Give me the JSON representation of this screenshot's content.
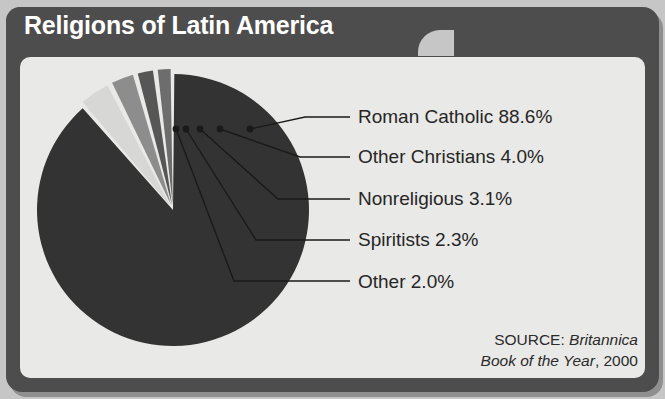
{
  "header": {
    "title": "Religions of Latin America"
  },
  "source": {
    "prefix": "SOURCE: ",
    "italic1": "Britannica",
    "italic2": "Book of the Year",
    "suffix": ", 2000"
  },
  "colors": {
    "frame": "#4d4d4d",
    "panel": "#e9e9e7",
    "background": "#c6c6c6",
    "title_text": "#ffffff",
    "label_text": "#262626",
    "leader_line": "#1a1a1a"
  },
  "chart_data": {
    "type": "pie",
    "title": "Religions of Latin America",
    "unit": "percent",
    "start_angle_deg": 0,
    "direction": "clockwise",
    "legend": "callout-labels",
    "grid": false,
    "categories": [
      "Roman Catholic",
      "Other Christians",
      "Nonreligious",
      "Spiritists",
      "Other"
    ],
    "values": [
      88.6,
      4.0,
      3.1,
      2.3,
      2.0
    ],
    "slice_colors": [
      "#333333",
      "#d7d7d5",
      "#8d8d8d",
      "#565656",
      "#6d6d6d"
    ],
    "slices": [
      {
        "label": "Roman Catholic 88.6%",
        "name": "Roman Catholic",
        "value": 88.6,
        "color": "#333333"
      },
      {
        "label": "Other Christians 4.0%",
        "name": "Other Christians",
        "value": 4.0,
        "color": "#d7d7d5"
      },
      {
        "label": "Nonreligious 3.1%",
        "name": "Nonreligious",
        "value": 3.1,
        "color": "#8d8d8d"
      },
      {
        "label": "Spiritists 2.3%",
        "name": "Spiritists",
        "value": 2.3,
        "color": "#565656"
      },
      {
        "label": "Other 2.0%",
        "name": "Other",
        "value": 2.0,
        "color": "#6d6d6d"
      }
    ]
  }
}
